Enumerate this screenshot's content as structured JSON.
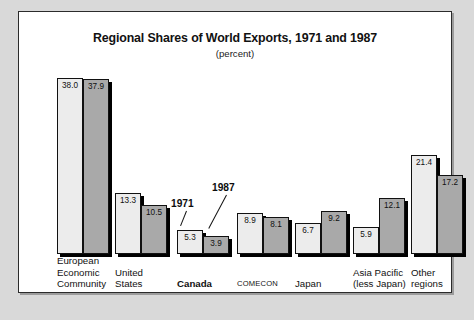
{
  "chart_data": {
    "type": "bar",
    "title": "Regional Shares of World Exports, 1971 and 1987",
    "subtitle": "(percent)",
    "xlabel": "",
    "ylabel": "",
    "ylim": [
      0,
      40
    ],
    "grid": false,
    "legend_position": "annotation-callouts",
    "categories": [
      "European Economic Community",
      "United States",
      "Canada",
      "COMECON",
      "Japan",
      "Asia Pacific (less Japan)",
      "Other regions"
    ],
    "category_lines": [
      [
        "European",
        "Economic",
        "Community"
      ],
      [
        "United",
        "States"
      ],
      [
        "Canada"
      ],
      [
        "COMECON"
      ],
      [
        "Japan"
      ],
      [
        "Asia Pacific",
        "(less Japan)"
      ],
      [
        "Other",
        "regions"
      ]
    ],
    "series": [
      {
        "name": "1971",
        "color": "#ececec",
        "values": [
          38.0,
          13.3,
          5.3,
          8.9,
          6.7,
          5.9,
          21.4
        ],
        "labels": [
          "38.0",
          "13.3",
          "5.3",
          "8.9",
          "6.7",
          "5.9",
          "21.4"
        ]
      },
      {
        "name": "1987",
        "color": "#a9a9a9",
        "values": [
          37.9,
          10.5,
          3.9,
          8.1,
          9.2,
          12.1,
          17.2
        ],
        "labels": [
          "37.9",
          "10.5",
          "3.9",
          "8.1",
          "9.2",
          "12.1",
          "17.2"
        ]
      }
    ],
    "annotations": [
      {
        "text": "1971",
        "target": "Canada 1971 bar"
      },
      {
        "text": "1987",
        "target": "Canada 1987 bar"
      }
    ]
  },
  "colors": {
    "page_background": "#d9d9d9",
    "panel_background": "#ffffff",
    "panel_border": "#2b2b2b",
    "bar_1971": "#ececec",
    "bar_1987": "#a9a9a9",
    "bar_outline": "#111111",
    "text": "#111111"
  }
}
